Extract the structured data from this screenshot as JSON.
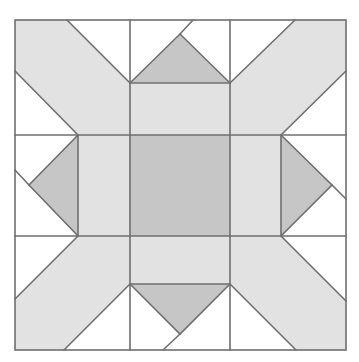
{
  "diagram": {
    "type": "quilt-block",
    "bounds": {
      "x": 15,
      "y": 20,
      "width": 331,
      "height": 330
    },
    "colors": {
      "background": "#ffffff",
      "light_gray": "#e2e2e2",
      "dark_gray": "#c6c6c6",
      "line": "#6f6f6f"
    },
    "grid": {
      "vertical_lines": [
        15,
        78,
        130,
        230,
        281,
        346
      ],
      "horizontal_lines": [
        20,
        83,
        135,
        236,
        284,
        350
      ]
    },
    "pieces": {
      "center_square": {
        "color": "dark_gray",
        "x": 130,
        "y": 135,
        "w": 100,
        "h": 101
      },
      "triangles": [
        {
          "name": "top",
          "color": "dark_gray",
          "points": "130,83 230,83 180,34"
        },
        {
          "name": "left",
          "color": "dark_gray",
          "points": "78,135 78,236 29,185"
        },
        {
          "name": "right",
          "color": "dark_gray",
          "points": "281,135 281,236 332,185"
        },
        {
          "name": "bottom",
          "color": "dark_gray",
          "points": "130,284 230,284 180,334"
        }
      ],
      "arms": [
        "top-left",
        "top-right",
        "bottom-left",
        "bottom-right"
      ]
    }
  }
}
